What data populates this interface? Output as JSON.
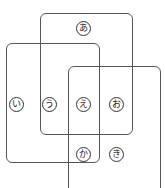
{
  "diagram": {
    "title_fragment": "",
    "sets": [
      {
        "id": "A",
        "x": 40,
        "y": 13,
        "w": 93,
        "h": 122
      },
      {
        "id": "B",
        "x": 6,
        "y": 43,
        "w": 94,
        "h": 120
      },
      {
        "id": "C",
        "x": 68,
        "y": 66,
        "w": 93,
        "h": 130
      }
    ],
    "labels": [
      {
        "text": "あ",
        "x": 83,
        "y": 28
      },
      {
        "text": "い",
        "x": 16,
        "y": 104
      },
      {
        "text": "う",
        "x": 49,
        "y": 104
      },
      {
        "text": "え",
        "x": 83,
        "y": 104
      },
      {
        "text": "お",
        "x": 116,
        "y": 104
      },
      {
        "text": "か",
        "x": 83,
        "y": 154
      },
      {
        "text": "き",
        "x": 116,
        "y": 154
      }
    ]
  }
}
